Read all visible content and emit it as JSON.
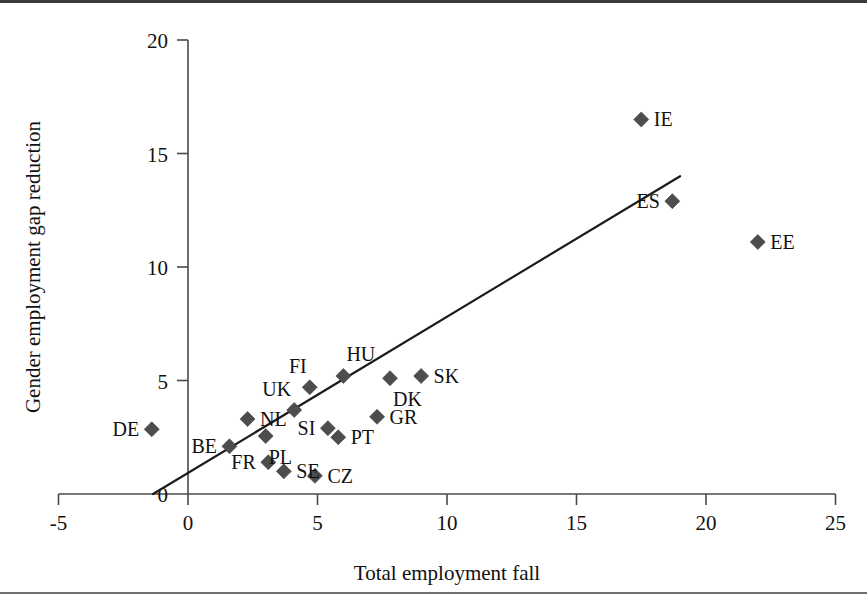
{
  "chart_data": {
    "type": "scatter",
    "title": "",
    "xlabel": "Total employment fall",
    "ylabel": "Gender employment gap reduction",
    "xlim": [
      -5,
      25
    ],
    "ylim": [
      0,
      20
    ],
    "xticks": [
      -5,
      0,
      5,
      10,
      15,
      20,
      25
    ],
    "yticks": [
      0,
      5,
      10,
      15,
      20
    ],
    "xtick_labels": [
      "-5",
      "0",
      "5",
      "10",
      "15",
      "20",
      "25"
    ],
    "ytick_labels": [
      "0",
      "5",
      "10",
      "15",
      "20"
    ],
    "grid": false,
    "legend": "none",
    "marker_shape": "diamond",
    "marker_color": "#4d4d4d",
    "trendline": {
      "visible": true,
      "color": "#1b1b1b",
      "x_start": -1.35,
      "y_start": 0.0,
      "x_end": 19.0,
      "y_end": 14.0
    },
    "points": [
      {
        "label": "DE",
        "x": -1.4,
        "y": 2.85,
        "label_side": "left"
      },
      {
        "label": "BE",
        "x": 1.6,
        "y": 2.1,
        "label_side": "left"
      },
      {
        "label": "NL",
        "x": 2.3,
        "y": 3.3,
        "label_side": "right"
      },
      {
        "label": "PL",
        "x": 3.0,
        "y": 2.55,
        "label_side": "below-right"
      },
      {
        "label": "FR",
        "x": 3.1,
        "y": 1.4,
        "label_side": "left"
      },
      {
        "label": "SE",
        "x": 3.7,
        "y": 1.0,
        "label_side": "right"
      },
      {
        "label": "UK",
        "x": 4.1,
        "y": 3.7,
        "label_side": "above-left"
      },
      {
        "label": "FI",
        "x": 4.7,
        "y": 4.7,
        "label_side": "above-left"
      },
      {
        "label": "CZ",
        "x": 4.9,
        "y": 0.8,
        "label_side": "right"
      },
      {
        "label": "SI",
        "x": 5.4,
        "y": 2.9,
        "label_side": "left"
      },
      {
        "label": "PT",
        "x": 5.8,
        "y": 2.5,
        "label_side": "right"
      },
      {
        "label": "HU",
        "x": 6.0,
        "y": 5.2,
        "label_side": "above-right"
      },
      {
        "label": "GR",
        "x": 7.3,
        "y": 3.4,
        "label_side": "right"
      },
      {
        "label": "DK",
        "x": 7.8,
        "y": 5.1,
        "label_side": "below-right"
      },
      {
        "label": "SK",
        "x": 9.0,
        "y": 5.2,
        "label_side": "right"
      },
      {
        "label": "IE",
        "x": 17.5,
        "y": 16.5,
        "label_side": "right"
      },
      {
        "label": "ES",
        "x": 18.7,
        "y": 12.9,
        "label_side": "left"
      },
      {
        "label": "EE",
        "x": 22.0,
        "y": 11.1,
        "label_side": "right"
      }
    ]
  },
  "figure": {
    "x_axis_title": "Total employment fall",
    "y_axis_title": "Gender employment gap reduction"
  }
}
